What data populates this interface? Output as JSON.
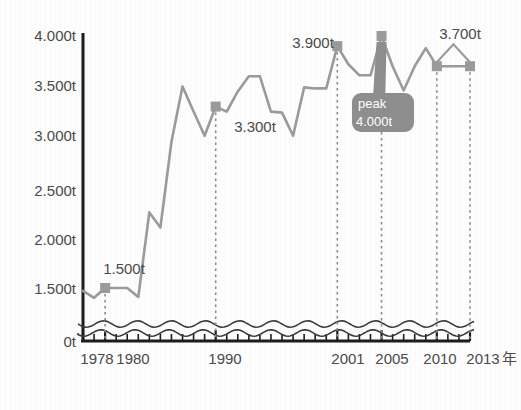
{
  "chart_data": {
    "type": "line",
    "title": "",
    "subtitle": "",
    "xlabel": "年",
    "ylabel": "",
    "unit": "t",
    "grid": false,
    "legend": "none",
    "axis_break": true,
    "axis_break_note": "wavy break between 0t and ~1.200t",
    "ylim": [
      0,
      4000
    ],
    "y_ticks": [
      {
        "value": 4000,
        "label": "4.000t"
      },
      {
        "value": 3500,
        "label": "3.500t"
      },
      {
        "value": 3000,
        "label": "3.000t"
      },
      {
        "value": 2500,
        "label": "2.500t"
      },
      {
        "value": 2000,
        "label": "2.000t"
      },
      {
        "value": 1500,
        "label": "1.500t"
      },
      {
        "value": 0,
        "label": "0t"
      }
    ],
    "xlim": [
      1978,
      2013
    ],
    "x_ticks_labeled": [
      {
        "value": 1978,
        "label": "1978"
      },
      {
        "value": 1980,
        "label": "1980"
      },
      {
        "value": 1990,
        "label": "1990"
      },
      {
        "value": 2001,
        "label": "2001"
      },
      {
        "value": 2005,
        "label": "2005"
      },
      {
        "value": 2010,
        "label": "2010"
      },
      {
        "value": 2013,
        "label": "2013"
      }
    ],
    "x_axis_suffix": "年",
    "x_minor_ticks_every": 1,
    "series": [
      {
        "name": "生産量",
        "color": "#9a9a9a",
        "x": [
          1978,
          1979,
          1980,
          1981,
          1982,
          1983,
          1984,
          1985,
          1986,
          1987,
          1988,
          1989,
          1990,
          1991,
          1992,
          1993,
          1994,
          1995,
          1996,
          1997,
          1998,
          1999,
          2000,
          2001,
          2002,
          2003,
          2004,
          2005,
          2006,
          2007,
          2008,
          2009,
          2010,
          2011,
          2012,
          2013
        ],
        "values": [
          1400,
          1150,
          1500,
          1500,
          1500,
          1180,
          2250,
          2100,
          2950,
          3500,
          3250,
          3010,
          3300,
          3250,
          3450,
          3600,
          3600,
          3250,
          3240,
          3010,
          3490,
          3480,
          3480,
          3900,
          3720,
          3610,
          3610,
          4000,
          3700,
          3460,
          3700,
          3880,
          3700,
          3700,
          3700,
          3700
        ]
      }
    ],
    "markers": [
      {
        "year": 1980,
        "value": 1500,
        "label": "1.500t"
      },
      {
        "year": 1990,
        "value": 3300,
        "label": "3.300t"
      },
      {
        "year": 2001,
        "value": 3900,
        "label": "3.900t"
      },
      {
        "year": 2005,
        "value": 4000,
        "label": "peak"
      },
      {
        "year": 2010,
        "value": 3700,
        "label": "3.700t"
      },
      {
        "year": 2013,
        "value": 3700,
        "label": "3.700t"
      }
    ],
    "annotations": [
      {
        "kind": "callout",
        "target_year": 2005,
        "target_value": 4000,
        "line1": "peak",
        "line2": "4.000t",
        "background": "#8e8e8e",
        "text_color": "#ffffff"
      },
      {
        "kind": "bracket",
        "from_year": 2010,
        "to_year": 2013,
        "label": "3.700t"
      }
    ],
    "colors": {
      "line": "#9a9a9a",
      "marker": "#9a9a9a",
      "axis": "#1c1c1c",
      "text": "#4a4a4a",
      "dotted_guide": "#8c8c8c",
      "callout_bg": "#8e8e8e",
      "background": "#fdfdfd"
    }
  },
  "labels": {
    "y": {
      "t4000": "4.000t",
      "t3500": "3.500t",
      "t3000": "3.000t",
      "t2500": "2.500t",
      "t2000": "2.000t",
      "t1500": "1.500t",
      "t0": "0t"
    },
    "x": {
      "y1978": "1978",
      "y1980": "1980",
      "y1990": "1990",
      "y2001": "2001",
      "y2005": "2005",
      "y2010": "2010",
      "y2013": "2013",
      "suffix": "年"
    },
    "points": {
      "p1500": "1.500t",
      "p3300": "3.300t",
      "p3900": "3.900t",
      "p3700": "3.700t"
    },
    "callout": {
      "line1": "peak",
      "line2": "4.000t"
    }
  }
}
